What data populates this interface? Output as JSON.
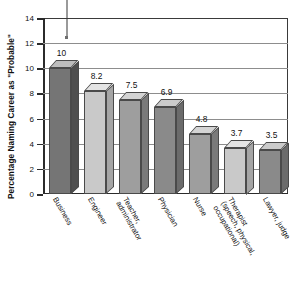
{
  "chart_data": {
    "type": "bar",
    "title": "",
    "xlabel": "",
    "ylabel": "Percentage Naming Career as \"Probable\"",
    "ylim": [
      0,
      14
    ],
    "yticks": [
      0,
      2,
      4,
      6,
      8,
      10,
      12,
      14
    ],
    "grid": true,
    "legend": null,
    "categories": [
      "Business",
      "Engineer",
      "Teacher, administrator",
      "Physician",
      "Nurse",
      "Therapist (speech, physical, occupational)",
      "Lawyer, judge"
    ],
    "category_lines": [
      [
        "Business"
      ],
      [
        "Engineer"
      ],
      [
        "Teacher,",
        "administrator"
      ],
      [
        "Physician"
      ],
      [
        "Nurse"
      ],
      [
        "Therapist",
        "(speech, physical,",
        "occupational)"
      ],
      [
        "Lawyer, judge"
      ]
    ],
    "values": [
      10,
      8.2,
      7.5,
      6.9,
      4.8,
      3.7,
      3.5
    ],
    "value_labels": [
      "10",
      "8.2",
      "7.5",
      "6.9",
      "4.8",
      "3.7",
      "3.5"
    ],
    "bar_shades": [
      "#757575",
      "#c9c9c9",
      "#9e9e9e",
      "#8a8a8a",
      "#9e9e9e",
      "#c9c9c9",
      "#8a8a8a"
    ],
    "bar_top_shades": [
      "#bdbdbd",
      "#e4e4e4",
      "#d4d4d4",
      "#cbcbcb",
      "#d4d4d4",
      "#e4e4e4",
      "#cbcbcb"
    ],
    "bar_side_shades": [
      "#4f4f4f",
      "#a5a5a5",
      "#7a7a7a",
      "#6b6b6b",
      "#7a7a7a",
      "#a5a5a5",
      "#6b6b6b"
    ],
    "style": "3d-column"
  },
  "annotation": {
    "pointer_name": "callout-pointer-line"
  },
  "colors": {
    "axis": "#2b2b2b",
    "grid": "#8d8d8d",
    "text": "#111111",
    "background": "#ffffff"
  }
}
